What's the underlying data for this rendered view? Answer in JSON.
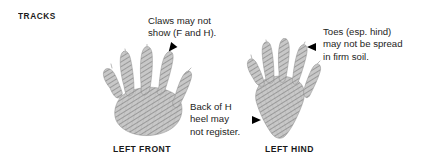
{
  "section": {
    "heading": "TRACKS"
  },
  "annotations": [
    {
      "id": "claws",
      "text": "Claws may not\nshow (F and H).",
      "arrow": "arrow-down-left-icon"
    },
    {
      "id": "toes",
      "text": "Toes (esp. hind)\nmay not be spread\nin firm soil.",
      "arrow": "arrow-left-icon"
    },
    {
      "id": "heel",
      "text": "Back of H\nheel may\nnot register.",
      "arrow": "arrow-right-icon"
    }
  ],
  "figures": [
    {
      "id": "front",
      "caption": "LEFT FRONT",
      "icon": "animal-track-front-paw-icon"
    },
    {
      "id": "hind",
      "caption": "LEFT HIND",
      "icon": "animal-track-hind-paw-icon"
    }
  ],
  "colors": {
    "background": "#ffffff",
    "text": "#1d1d1b",
    "heading": "#1a1a1a",
    "arrow": "#000000",
    "track_fill": "#a9a9a9",
    "track_hatch": "#6e6e6e"
  }
}
